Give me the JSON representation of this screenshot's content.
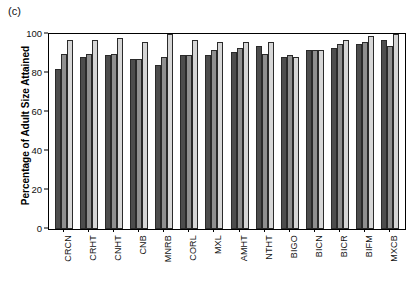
{
  "figure": {
    "panel_label": "(c)",
    "ylabel": "Percentage of Adult Size Attained"
  },
  "chart_data": {
    "type": "bar",
    "title": "",
    "subtitle": "",
    "xlabel": "",
    "ylabel": "Percentage of Adult Size Attained",
    "ylim": [
      0,
      100
    ],
    "yticks": [
      0,
      20,
      40,
      60,
      80,
      100
    ],
    "ytick_labels": [
      "0",
      "20",
      "40",
      "60",
      "80",
      "100"
    ],
    "grid": false,
    "legend": "none",
    "panel_label": "(c)",
    "categories": [
      "CRCN",
      "CRHT",
      "CNHT",
      "CNB",
      "MNRB",
      "CORL",
      "MXL",
      "AMHT",
      "NTHT",
      "BIGO",
      "BICN",
      "BICR",
      "BIFM",
      "MXCB"
    ],
    "series": [
      {
        "name": "series-1",
        "color": "#4d4d4d",
        "values": [
          82,
          88,
          89,
          87,
          84,
          89,
          89,
          91,
          94,
          88,
          92,
          93,
          95,
          97
        ]
      },
      {
        "name": "series-2",
        "color": "#8f8f8f",
        "values": [
          90,
          90,
          90,
          87,
          88,
          89,
          92,
          93,
          90,
          89,
          92,
          95,
          96,
          94
        ]
      },
      {
        "name": "series-3",
        "color": "#d6d6d6",
        "values": [
          97,
          97,
          98,
          96,
          100,
          97,
          96,
          96,
          96,
          88,
          92,
          97,
          99,
          100
        ]
      }
    ]
  }
}
